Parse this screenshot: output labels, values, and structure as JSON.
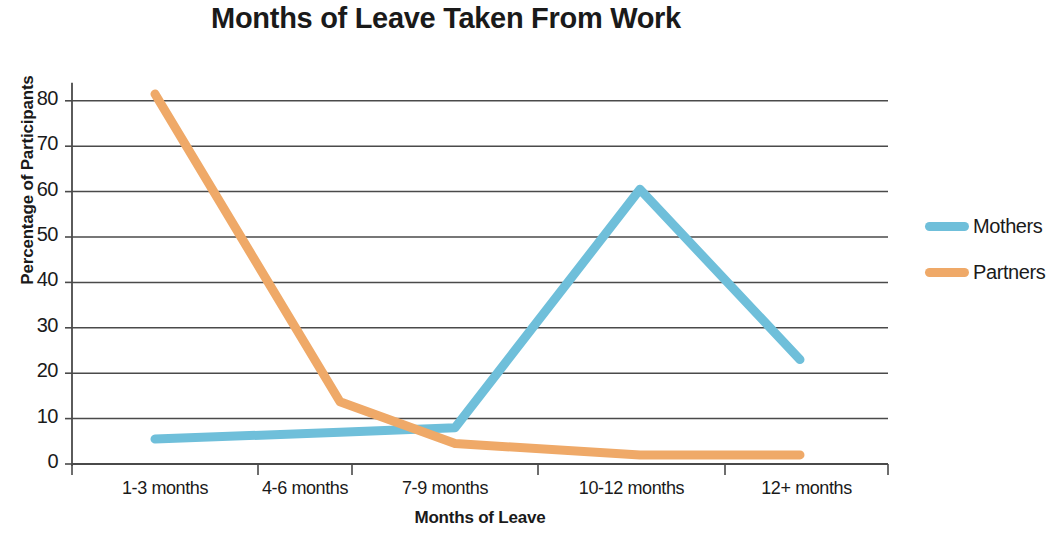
{
  "chart_data": {
    "type": "line",
    "title": "Months of Leave Taken From Work",
    "xlabel": "Months of Leave",
    "ylabel": "Percentage of Participants",
    "categories": [
      "1-3 months",
      "4-6 months",
      "7-9 months",
      "10-12 months",
      "12+ months"
    ],
    "series": [
      {
        "name": "Mothers",
        "color": "#6FBFDA",
        "values": [
          5.5,
          7,
          8,
          60.5,
          23
        ]
      },
      {
        "name": "Partners",
        "color": "#EFA968",
        "values": [
          81.5,
          13.7,
          4.5,
          2,
          2
        ]
      }
    ],
    "ylim": [
      0,
      85
    ],
    "yticks": [
      0,
      10,
      20,
      30,
      40,
      50,
      60,
      70,
      80
    ],
    "ytick_labels": [
      "0",
      "10",
      "20",
      "30",
      "40",
      "50",
      "60",
      "70",
      "80"
    ],
    "grid": "horizontal",
    "legend_position": "right"
  }
}
